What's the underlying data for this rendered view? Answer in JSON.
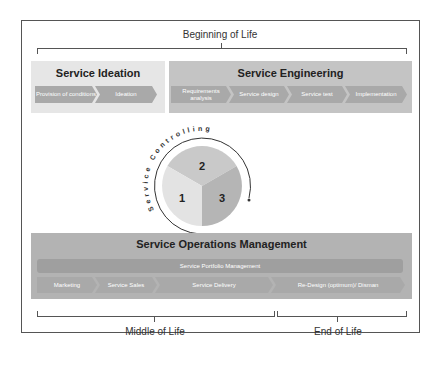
{
  "phases": {
    "beginning": "Beginning of Life",
    "middle": "Middle of Life",
    "end": "End of Life"
  },
  "ideation": {
    "title": "Service Ideation",
    "steps": [
      "Provision of conditions",
      "Ideation"
    ]
  },
  "engineering": {
    "title": "Service Engineering",
    "steps": [
      "Requirements analysis",
      "Service design",
      "Service test",
      "Implementation"
    ]
  },
  "controlling": {
    "title": "Service Controlling",
    "segments": [
      "1",
      "2",
      "3"
    ]
  },
  "operations": {
    "title": "Service Operations Management",
    "portfolio": "Service Portfolio Management",
    "steps": [
      "Marketing",
      "Service Sales",
      "Service Delivery",
      "Re-Design (optimum)/ Disman"
    ]
  },
  "colors": {
    "ideation_bg": "#e6e6e6",
    "engineering_bg": "#c4c4c4",
    "operations_bg": "#b3b3b3",
    "segment1": "#e3e3e3",
    "segment2": "#c9c9c9",
    "segment3": "#b5b5b5"
  }
}
